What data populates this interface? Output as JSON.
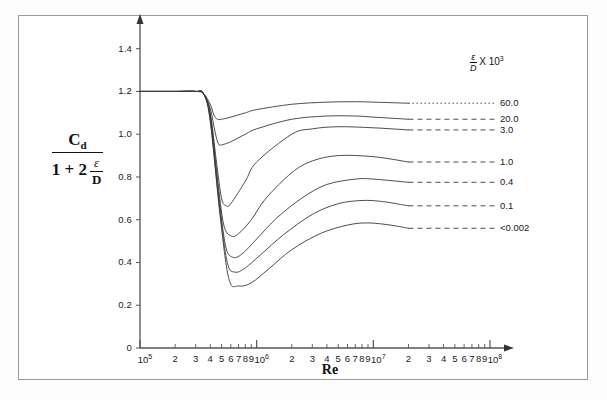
{
  "chart_data": {
    "type": "line",
    "title": "",
    "xlabel": "Re",
    "ylabel": "Cd / (1 + 2 ε/D)",
    "ylabel_numerator": "C",
    "ylabel_numerator_sub": "d",
    "ylabel_denominator_prefix": "1 + 2",
    "ylabel_denominator_frac_num": "ε",
    "ylabel_denominator_frac_den": "D",
    "xscale": "log",
    "xlim": [
      100000,
      100000000
    ],
    "ylim": [
      0,
      1.45
    ],
    "grid": false,
    "legend_position": "right",
    "legend_title_num": "ε",
    "legend_title_den": "D",
    "legend_title_factor": "X 10",
    "legend_title_exp": "3",
    "yticks": [
      "0",
      "0.2",
      "0.4",
      "0.6",
      "0.8",
      "1.0",
      "1.2",
      "1.4"
    ],
    "ytick_values": [
      0,
      0.2,
      0.4,
      0.6,
      0.8,
      1.0,
      1.2,
      1.4
    ],
    "xtick_labels": [
      {
        "text": "10",
        "exp": "5",
        "value": 100000
      },
      {
        "text": "2",
        "exp": "",
        "value": 200000
      },
      {
        "text": "3",
        "exp": "",
        "value": 300000
      },
      {
        "text": "4",
        "exp": "",
        "value": 400000
      },
      {
        "text": "5",
        "exp": "",
        "value": 500000
      },
      {
        "text": "6",
        "exp": "",
        "value": 600000
      },
      {
        "text": "7",
        "exp": "",
        "value": 700000
      },
      {
        "text": "8",
        "exp": "",
        "value": 800000
      },
      {
        "text": "9",
        "exp": "",
        "value": 900000
      },
      {
        "text": "10",
        "exp": "6",
        "value": 1000000
      },
      {
        "text": "2",
        "exp": "",
        "value": 2000000
      },
      {
        "text": "3",
        "exp": "",
        "value": 3000000
      },
      {
        "text": "4",
        "exp": "",
        "value": 4000000
      },
      {
        "text": "5",
        "exp": "",
        "value": 5000000
      },
      {
        "text": "6",
        "exp": "",
        "value": 6000000
      },
      {
        "text": "7",
        "exp": "",
        "value": 7000000
      },
      {
        "text": "8",
        "exp": "",
        "value": 8000000
      },
      {
        "text": "9",
        "exp": "",
        "value": 9000000
      },
      {
        "text": "10",
        "exp": "7",
        "value": 10000000
      },
      {
        "text": "2",
        "exp": "",
        "value": 20000000
      },
      {
        "text": "3",
        "exp": "",
        "value": 30000000
      },
      {
        "text": "4",
        "exp": "",
        "value": 40000000
      },
      {
        "text": "5",
        "exp": "",
        "value": 50000000
      },
      {
        "text": "6",
        "exp": "",
        "value": 60000000
      },
      {
        "text": "7",
        "exp": "",
        "value": 70000000
      },
      {
        "text": "8",
        "exp": "",
        "value": 80000000
      },
      {
        "text": "9",
        "exp": "",
        "value": 90000000
      },
      {
        "text": "10",
        "exp": "8",
        "value": 100000000
      }
    ],
    "series": [
      {
        "name": "60.0",
        "label": "60.0",
        "legend_label": "60.0",
        "linestyle": "solid",
        "tail_linestyle": "dotted",
        "x": [
          100000,
          200000,
          300000,
          350000,
          400000,
          430000,
          460000,
          500000,
          600000,
          800000,
          1000000,
          2000000,
          4000000,
          7000000,
          10000000,
          20000000
        ],
        "values": [
          1.2,
          1.2,
          1.2,
          1.19,
          1.14,
          1.09,
          1.07,
          1.07,
          1.08,
          1.1,
          1.115,
          1.14,
          1.15,
          1.152,
          1.15,
          1.145
        ]
      },
      {
        "name": "20.0",
        "label": "20.0",
        "legend_label": "20.0",
        "linestyle": "solid",
        "tail_linestyle": "dashed",
        "x": [
          100000,
          200000,
          300000,
          350000,
          400000,
          440000,
          470000,
          500000,
          600000,
          800000,
          1000000,
          2000000,
          4000000,
          7000000,
          10000000,
          20000000
        ],
        "values": [
          1.2,
          1.2,
          1.2,
          1.19,
          1.12,
          1.01,
          0.955,
          0.95,
          0.965,
          1.0,
          1.025,
          1.07,
          1.085,
          1.085,
          1.08,
          1.07
        ]
      },
      {
        "name": "3.0",
        "label": "3.0",
        "legend_label": "3.0",
        "linestyle": "solid",
        "tail_linestyle": "dashed",
        "x": [
          100000,
          200000,
          300000,
          350000,
          400000,
          450000,
          500000,
          550000,
          600000,
          800000,
          1000000,
          2000000,
          3000000,
          5000000,
          10000000,
          20000000
        ],
        "values": [
          1.2,
          1.2,
          1.2,
          1.19,
          1.1,
          0.88,
          0.7,
          0.665,
          0.675,
          0.78,
          0.87,
          1.0,
          1.025,
          1.035,
          1.03,
          1.02
        ]
      },
      {
        "name": "1.0",
        "label": "1.0",
        "legend_label": "1.0",
        "linestyle": "solid",
        "tail_linestyle": "dashed",
        "x": [
          100000,
          200000,
          300000,
          350000,
          400000,
          460000,
          520000,
          600000,
          700000,
          900000,
          1200000,
          2000000,
          3000000,
          5000000,
          10000000,
          20000000
        ],
        "values": [
          1.2,
          1.2,
          1.2,
          1.19,
          1.09,
          0.8,
          0.58,
          0.525,
          0.535,
          0.6,
          0.7,
          0.82,
          0.875,
          0.9,
          0.895,
          0.87
        ]
      },
      {
        "name": "0.4",
        "label": "0.4",
        "legend_label": "0.4",
        "linestyle": "solid",
        "tail_linestyle": "dashed",
        "x": [
          100000,
          200000,
          300000,
          350000,
          400000,
          470000,
          540000,
          620000,
          750000,
          1000000,
          1500000,
          2500000,
          4000000,
          7000000,
          10000000,
          20000000
        ],
        "values": [
          1.2,
          1.2,
          1.2,
          1.19,
          1.08,
          0.73,
          0.48,
          0.425,
          0.44,
          0.51,
          0.61,
          0.705,
          0.765,
          0.79,
          0.79,
          0.775
        ]
      },
      {
        "name": "0.1",
        "label": "0.1",
        "legend_label": "0.1",
        "linestyle": "solid",
        "tail_linestyle": "dashed",
        "x": [
          100000,
          200000,
          300000,
          350000,
          400000,
          480000,
          560000,
          650000,
          800000,
          1100000,
          1700000,
          3000000,
          5000000,
          8000000,
          12000000,
          20000000
        ],
        "values": [
          1.2,
          1.2,
          1.2,
          1.19,
          1.07,
          0.66,
          0.4,
          0.355,
          0.375,
          0.44,
          0.53,
          0.625,
          0.675,
          0.69,
          0.685,
          0.665
        ]
      },
      {
        "name": "<0.002",
        "label": "<0.002",
        "legend_label": "<0.002",
        "linestyle": "solid",
        "tail_linestyle": "dashed",
        "x": [
          100000,
          200000,
          300000,
          350000,
          400000,
          490000,
          580000,
          700000,
          900000,
          1300000,
          2000000,
          3500000,
          6000000,
          9000000,
          14000000,
          20000000
        ],
        "values": [
          1.2,
          1.2,
          1.2,
          1.19,
          1.06,
          0.6,
          0.32,
          0.29,
          0.305,
          0.375,
          0.46,
          0.535,
          0.575,
          0.585,
          0.575,
          0.56
        ]
      }
    ]
  },
  "axis": {
    "y_arrow": true,
    "x_arrow": true
  }
}
